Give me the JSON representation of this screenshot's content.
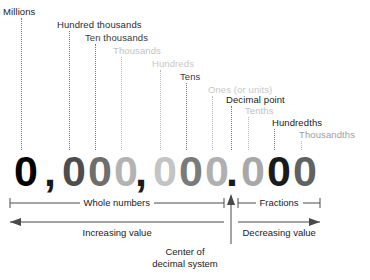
{
  "diagram": {
    "number": {
      "text": "0,000,000.000",
      "digits": [
        {
          "char": "0",
          "x": 14,
          "color": "#000000",
          "place": "millions"
        },
        {
          "char": "0",
          "x": 62,
          "color": "#4d4d4d",
          "place": "hundred-thousands"
        },
        {
          "char": "0",
          "x": 88,
          "color": "#6e6e6e",
          "place": "ten-thousands"
        },
        {
          "char": "0",
          "x": 114,
          "color": "#b3b3b3",
          "place": "thousands"
        },
        {
          "char": "0",
          "x": 153,
          "color": "#c4c4c4",
          "place": "hundreds"
        },
        {
          "char": "0",
          "x": 179,
          "color": "#7a7a7a",
          "place": "tens"
        },
        {
          "char": "0",
          "x": 205,
          "color": "#b0b0b0",
          "place": "ones"
        },
        {
          "char": "0",
          "x": 241,
          "color": "#a8a8a8",
          "place": "tenths"
        },
        {
          "char": "0",
          "x": 267,
          "color": "#1a1a1a",
          "place": "hundredths"
        },
        {
          "char": "0",
          "x": 293,
          "color": "#616161",
          "place": "thousandths"
        }
      ],
      "separators": [
        {
          "char": ",",
          "x": 44,
          "color": "#1a1a1a",
          "name": "thousands-comma"
        },
        {
          "char": ",",
          "x": 135,
          "color": "#1a1a1a",
          "name": "millions-comma"
        },
        {
          "char": ".",
          "x": 226,
          "color": "#1a1a1a",
          "name": "decimal-point"
        }
      ]
    },
    "labels": [
      {
        "text": "Millions",
        "x": 3,
        "y": 6,
        "color": "#1a1a1a",
        "leader_x": 21,
        "leader_top": 18,
        "leader_bottom": 150,
        "leader_shade": "dark"
      },
      {
        "text": "Hundred thousands",
        "x": 57,
        "y": 19,
        "color": "#2b2b2b",
        "leader_x": 69,
        "leader_top": 31,
        "leader_bottom": 150,
        "leader_shade": "dark"
      },
      {
        "text": "Ten thousands",
        "x": 85,
        "y": 32,
        "color": "#3a3a3a",
        "leader_x": 95,
        "leader_top": 44,
        "leader_bottom": 150,
        "leader_shade": "dark"
      },
      {
        "text": "Thousands",
        "x": 113,
        "y": 45,
        "color": "#c2c2c2",
        "leader_x": 121,
        "leader_top": 57,
        "leader_bottom": 150,
        "leader_shade": "light"
      },
      {
        "text": "Hundreds",
        "x": 152,
        "y": 58,
        "color": "#c8c8c8",
        "leader_x": 160,
        "leader_top": 70,
        "leader_bottom": 150,
        "leader_shade": "light"
      },
      {
        "text": "Tens",
        "x": 180,
        "y": 71,
        "color": "#3a3a3a",
        "leader_x": 186,
        "leader_top": 83,
        "leader_bottom": 150,
        "leader_shade": "dark"
      },
      {
        "text": "Ones (or units)",
        "x": 208,
        "y": 84,
        "color": "#c8c8c8",
        "leader_x": 212,
        "leader_top": 96,
        "leader_bottom": 150,
        "leader_shade": "light"
      },
      {
        "text": "Decimal point",
        "x": 226,
        "y": 94,
        "color": "#1a1a1a",
        "leader_x": 231,
        "leader_top": 106,
        "leader_bottom": 150,
        "leader_shade": "dark"
      },
      {
        "text": "Tenths",
        "x": 245,
        "y": 105,
        "color": "#c2c2c2",
        "leader_x": 248,
        "leader_top": 117,
        "leader_bottom": 150,
        "leader_shade": "light"
      },
      {
        "text": "Hundredths",
        "x": 272,
        "y": 117,
        "color": "#1a1a1a",
        "leader_x": 274,
        "leader_top": 129,
        "leader_bottom": 150,
        "leader_shade": "dark"
      },
      {
        "text": "Thousandths",
        "x": 299,
        "y": 129,
        "color": "#9e9e9e",
        "leader_x": 301,
        "leader_top": 141,
        "leader_bottom": 150,
        "leader_shade": "light"
      }
    ],
    "brackets": [
      {
        "name": "whole-numbers",
        "label": "Whole numbers",
        "x1": 10,
        "x2": 224,
        "label_x": 117
      },
      {
        "name": "fractions",
        "label": "Fractions",
        "x1": 238,
        "x2": 320,
        "label_x": 279
      }
    ],
    "arrows": [
      {
        "name": "increasing-value",
        "label": "Increasing value",
        "x1": 10,
        "x2": 224,
        "direction": "left",
        "label_x": 117
      },
      {
        "name": "decreasing-value",
        "label": "Decreasing value",
        "x1": 238,
        "x2": 320,
        "direction": "right",
        "label_x": 279
      }
    ],
    "center_marker": {
      "x": 231,
      "caption_line1": "Center of",
      "caption_line2": "decimal system"
    },
    "colors": {
      "ink": "#1a1a1a",
      "rule": "#4a4a4a",
      "leader_light": "#b9b9b9",
      "leader_dark": "#7d7d7d",
      "background": "#ffffff"
    }
  }
}
